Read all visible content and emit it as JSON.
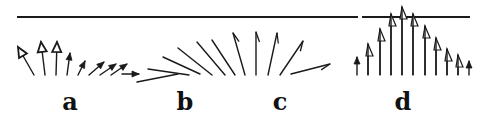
{
  "figure": {
    "stroke_color": "#1a1a1a",
    "background": "#ffffff",
    "baseline": {
      "y": 17,
      "segments": [
        [
          17,
          358
        ],
        [
          362,
          470
        ]
      ]
    },
    "panels": [
      {
        "id": "a",
        "label": "a",
        "label_pos": [
          70,
          90
        ],
        "arrows": [
          {
            "x1": 34,
            "y1": 75,
            "x2": 18,
            "y2": 47,
            "head": "open-large"
          },
          {
            "x1": 45,
            "y1": 75,
            "x2": 41,
            "y2": 42,
            "head": "open-large"
          },
          {
            "x1": 56,
            "y1": 75,
            "x2": 57,
            "y2": 42,
            "head": "open-large"
          },
          {
            "x1": 67,
            "y1": 75,
            "x2": 70,
            "y2": 53,
            "head": "filled"
          },
          {
            "x1": 78,
            "y1": 75,
            "x2": 85,
            "y2": 61,
            "head": "filled"
          },
          {
            "x1": 89,
            "y1": 75,
            "x2": 104,
            "y2": 62,
            "head": "filled"
          },
          {
            "x1": 100,
            "y1": 75,
            "x2": 116,
            "y2": 64,
            "head": "filled"
          },
          {
            "x1": 111,
            "y1": 75,
            "x2": 127,
            "y2": 64,
            "head": "filled"
          },
          {
            "x1": 122,
            "y1": 74,
            "x2": 139,
            "y2": 74,
            "head": "filled"
          }
        ]
      },
      {
        "id": "b",
        "label": "b",
        "label_pos": [
          185,
          90
        ],
        "lines": [
          {
            "x1": 137,
            "y1": 82,
            "x2": 178,
            "y2": 74
          },
          {
            "x1": 148,
            "y1": 69,
            "x2": 189,
            "y2": 75
          },
          {
            "x1": 163,
            "y1": 57,
            "x2": 200,
            "y2": 74
          },
          {
            "x1": 178,
            "y1": 48,
            "x2": 212,
            "y2": 75
          },
          {
            "x1": 197,
            "y1": 42,
            "x2": 225,
            "y2": 75
          },
          {
            "x1": 212,
            "y1": 40,
            "x2": 235,
            "y2": 75
          }
        ]
      },
      {
        "id": "c",
        "label": "c",
        "label_pos": [
          280,
          90
        ],
        "arrows": [
          {
            "x1": 245,
            "y1": 75,
            "x2": 233,
            "y2": 33,
            "head": "barb"
          },
          {
            "x1": 256,
            "y1": 75,
            "x2": 256,
            "y2": 32,
            "head": "barb"
          },
          {
            "x1": 268,
            "y1": 75,
            "x2": 277,
            "y2": 33,
            "head": "barb"
          },
          {
            "x1": 280,
            "y1": 75,
            "x2": 303,
            "y2": 41,
            "head": "barb"
          },
          {
            "x1": 291,
            "y1": 74,
            "x2": 330,
            "y2": 64,
            "head": "barb"
          }
        ]
      },
      {
        "id": "d",
        "label": "d",
        "label_pos": [
          403,
          90
        ],
        "arrows": [
          {
            "x1": 357,
            "y1": 75,
            "x2": 357,
            "y2": 57,
            "head": "filled"
          },
          {
            "x1": 368,
            "y1": 75,
            "x2": 368,
            "y2": 44,
            "head": "half-open"
          },
          {
            "x1": 380,
            "y1": 75,
            "x2": 380,
            "y2": 29,
            "head": "half-open"
          },
          {
            "x1": 391,
            "y1": 75,
            "x2": 391,
            "y2": 14,
            "head": "half-open"
          },
          {
            "x1": 402,
            "y1": 75,
            "x2": 402,
            "y2": 7,
            "head": "half-open"
          },
          {
            "x1": 413,
            "y1": 75,
            "x2": 413,
            "y2": 14,
            "head": "half-open"
          },
          {
            "x1": 425,
            "y1": 75,
            "x2": 425,
            "y2": 26,
            "head": "half-open"
          },
          {
            "x1": 436,
            "y1": 75,
            "x2": 436,
            "y2": 38,
            "head": "half-open"
          },
          {
            "x1": 447,
            "y1": 75,
            "x2": 447,
            "y2": 49,
            "head": "half-open"
          },
          {
            "x1": 458,
            "y1": 75,
            "x2": 458,
            "y2": 55,
            "head": "half-open"
          },
          {
            "x1": 469,
            "y1": 75,
            "x2": 469,
            "y2": 61,
            "head": "filled"
          }
        ]
      }
    ]
  }
}
